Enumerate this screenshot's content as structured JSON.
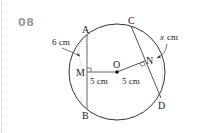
{
  "problem": {
    "number": "08"
  },
  "figure": {
    "circle": {
      "center_label": "O"
    },
    "points": {
      "A": "A",
      "B": "B",
      "C": "C",
      "D": "D",
      "M": "M",
      "N": "N"
    },
    "labels": {
      "ma_length": "6 cm",
      "om_distance": "5 cm",
      "on_distance": "5 cm",
      "nd_length_x": "x",
      "nd_length_unit": "cm"
    }
  }
}
